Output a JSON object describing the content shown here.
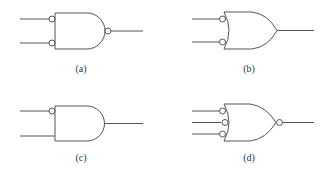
{
  "diagram": {
    "stroke_color": "#555555",
    "background": "#ffffff",
    "gates": [
      {
        "id": "a",
        "label": "(a)",
        "shape": "AND",
        "inputs": 2,
        "inverted_inputs": [
          true,
          true
        ],
        "inverted_output": true
      },
      {
        "id": "b",
        "label": "(b)",
        "shape": "OR",
        "inputs": 2,
        "inverted_inputs": [
          true,
          true
        ],
        "inverted_output": false
      },
      {
        "id": "c",
        "label": "(c)",
        "shape": "AND",
        "inputs": 2,
        "inverted_inputs": [
          true,
          false
        ],
        "inverted_output": false
      },
      {
        "id": "d",
        "label": "(d)",
        "shape": "OR",
        "inputs": 3,
        "inverted_inputs": [
          true,
          true,
          true
        ],
        "inverted_output": true
      }
    ]
  }
}
